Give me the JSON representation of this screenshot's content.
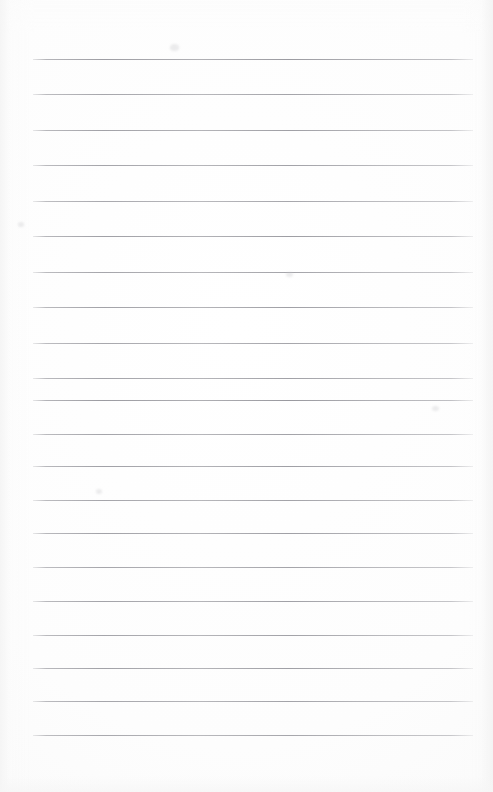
{
  "document": {
    "kind": "ruled-notepaper",
    "title": "",
    "body_text": "",
    "page_width": 493,
    "page_height": 792,
    "paper_color": "#fdfdfd",
    "rule_color": "#8e8e95"
  },
  "rules": {
    "count": 20,
    "x_start": 33,
    "x_end": 473,
    "first_y": 59,
    "spacing": 35.6,
    "thickness": 1,
    "lines": [
      {
        "index": 1,
        "y": 59,
        "x1": 33,
        "x2": 473,
        "opacity": 0.9
      },
      {
        "index": 2,
        "y": 94,
        "x1": 33,
        "x2": 473,
        "opacity": 0.82
      },
      {
        "index": 3,
        "y": 130,
        "x1": 33,
        "x2": 473,
        "opacity": 0.86
      },
      {
        "index": 4,
        "y": 165,
        "x1": 33,
        "x2": 473,
        "opacity": 0.84
      },
      {
        "index": 5,
        "y": 201,
        "x1": 33,
        "x2": 473,
        "opacity": 0.8
      },
      {
        "index": 6,
        "y": 236,
        "x1": 33,
        "x2": 473,
        "opacity": 0.88
      },
      {
        "index": 7,
        "y": 272,
        "x1": 33,
        "x2": 473,
        "opacity": 0.83
      },
      {
        "index": 8,
        "y": 307,
        "x1": 33,
        "x2": 473,
        "opacity": 0.86
      },
      {
        "index": 9,
        "y": 343,
        "x1": 33,
        "x2": 473,
        "opacity": 0.81
      },
      {
        "index": 10,
        "y": 378,
        "x1": 33,
        "x2": 473,
        "opacity": 0.85
      },
      {
        "index": 11,
        "y": 400,
        "x1": 33,
        "x2": 473,
        "opacity": 0.92
      },
      {
        "index": 12,
        "y": 434,
        "x1": 33,
        "x2": 473,
        "opacity": 0.84
      },
      {
        "index": 13,
        "y": 466,
        "x1": 33,
        "x2": 473,
        "opacity": 0.87
      },
      {
        "index": 14,
        "y": 500,
        "x1": 33,
        "x2": 473,
        "opacity": 0.83
      },
      {
        "index": 15,
        "y": 533,
        "x1": 33,
        "x2": 473,
        "opacity": 0.86
      },
      {
        "index": 16,
        "y": 567,
        "x1": 33,
        "x2": 473,
        "opacity": 0.82
      },
      {
        "index": 17,
        "y": 601,
        "x1": 33,
        "x2": 473,
        "opacity": 0.85
      },
      {
        "index": 18,
        "y": 635,
        "x1": 33,
        "x2": 473,
        "opacity": 0.84
      },
      {
        "index": 19,
        "y": 668,
        "x1": 33,
        "x2": 473,
        "opacity": 0.86
      },
      {
        "index": 20,
        "y": 701,
        "x1": 33,
        "x2": 473,
        "opacity": 0.83
      },
      {
        "index": 21,
        "y": 735,
        "x1": 33,
        "x2": 473,
        "opacity": 0.8
      }
    ]
  },
  "marks": [
    {
      "name": "stray-scan-speck",
      "x": 170,
      "y": 44,
      "w": 9,
      "h": 7
    },
    {
      "name": "stray-scan-speck",
      "x": 286,
      "y": 272,
      "w": 7,
      "h": 5
    },
    {
      "name": "stray-scan-speck",
      "x": 18,
      "y": 222,
      "w": 6,
      "h": 5
    },
    {
      "name": "stray-scan-speck",
      "x": 432,
      "y": 406,
      "w": 7,
      "h": 5
    },
    {
      "name": "stray-scan-speck",
      "x": 96,
      "y": 489,
      "w": 6,
      "h": 5
    }
  ]
}
